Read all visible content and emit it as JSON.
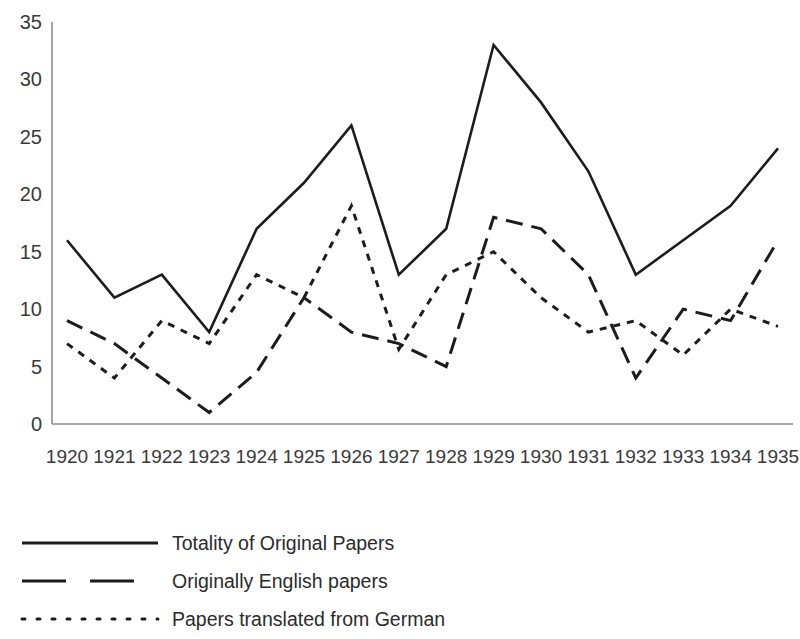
{
  "chart_data": {
    "type": "line",
    "title": "",
    "subtitle": "",
    "xlabel": "",
    "ylabel": "",
    "categories": [
      "1920",
      "1921",
      "1922",
      "1923",
      "1924",
      "1925",
      "1926",
      "1927",
      "1928",
      "1929",
      "1930",
      "1931",
      "1932",
      "1933",
      "1934",
      "1935"
    ],
    "ylim": [
      0,
      35
    ],
    "yticks": [
      0,
      5,
      10,
      15,
      20,
      25,
      30,
      35
    ],
    "grid": false,
    "legend_position": "bottom-left",
    "series": [
      {
        "name": "Totality of Original Papers",
        "style": "solid",
        "color": "#1c1c1c",
        "values": [
          16,
          11,
          13,
          8,
          17,
          21,
          26,
          13,
          17,
          33,
          28,
          22,
          13,
          16,
          19,
          24
        ]
      },
      {
        "name": "Originally English papers",
        "style": "dashed",
        "color": "#1c1c1c",
        "values": [
          9,
          7,
          4,
          1,
          4.5,
          11,
          8,
          7,
          5,
          18,
          17,
          13,
          4,
          10,
          9,
          16
        ]
      },
      {
        "name": "Papers translated from German",
        "style": "dotted",
        "color": "#1c1c1c",
        "values": [
          7,
          4,
          9,
          7,
          13,
          11,
          19,
          6.5,
          13,
          15,
          11,
          8,
          9,
          6,
          10,
          8.5
        ]
      }
    ]
  },
  "axes": {
    "y_tick_labels": [
      "35",
      "30",
      "25",
      "20",
      "15",
      "10",
      "5",
      "0"
    ],
    "x_tick_labels": [
      "1920",
      "1921",
      "1922",
      "1923",
      "1924",
      "1925",
      "1926",
      "1927",
      "1928",
      "1929",
      "1930",
      "1931",
      "1932",
      "1933",
      "1934",
      "1935"
    ]
  },
  "legend": {
    "entries": [
      {
        "label": "Totality of Original Papers",
        "style": "solid"
      },
      {
        "label": "Originally English papers",
        "style": "dashed"
      },
      {
        "label": "Papers translated from German",
        "style": "dotted"
      }
    ]
  }
}
